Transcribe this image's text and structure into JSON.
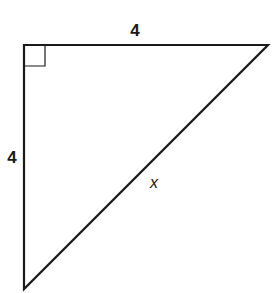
{
  "figure": {
    "type": "right-triangle",
    "stroke_color": "#1a1a1a",
    "background": "#ffffff",
    "vertices": {
      "right_angle": [
        24,
        45
      ],
      "top_right": [
        268,
        45
      ],
      "bottom": [
        24,
        289
      ]
    },
    "right_angle_marker_size": 21
  },
  "labels": {
    "top_side": "4",
    "left_side": "4",
    "hypotenuse": "x"
  },
  "label_positions": {
    "top_side": [
      135,
      30
    ],
    "left_side": [
      12,
      157
    ],
    "hypotenuse": [
      154,
      183
    ]
  }
}
